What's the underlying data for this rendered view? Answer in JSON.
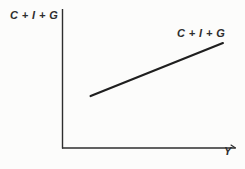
{
  "figure": {
    "kind": "economics textbook diagram (Keynesian cross / aggregate expenditure)",
    "y_axis_label": "C + I + G",
    "x_axis_label": "Y",
    "curve_label": "C + I + G"
  },
  "colors": {
    "ink": "#2e2e2e",
    "line": "#1f1f1f",
    "paper": "#fcfcfb"
  },
  "chart_data": {
    "type": "line",
    "title": "",
    "xlabel": "Y",
    "ylabel": "C + I + G",
    "tick_labels": [],
    "grid": false,
    "legend": "inline label above right end of the line",
    "xlim_norm": [
      0,
      1
    ],
    "ylim_norm": [
      0,
      1
    ],
    "series": [
      {
        "name": "C + I + G",
        "description": "straight upward-sloping aggregate expenditure line with positive vertical intercept; does not touch either axis",
        "points_norm": [
          {
            "x": 0.163,
            "y": 0.374
          },
          {
            "x": 0.93,
            "y": 0.755
          }
        ]
      }
    ]
  }
}
